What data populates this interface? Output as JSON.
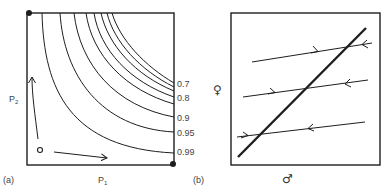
{
  "panel_a": {
    "tag": "(a)",
    "x_axis": {
      "base": "P",
      "sub": "1"
    },
    "y_axis": {
      "base": "P",
      "sub": "2"
    },
    "origin_marker": "O",
    "contours": [
      {
        "label": "0.7"
      },
      {
        "label": "0.8"
      },
      {
        "label": "0.9"
      },
      {
        "label": "0.95"
      },
      {
        "label": "0.99"
      }
    ],
    "corner_points": [
      "top-left",
      "bottom-right"
    ]
  },
  "panel_b": {
    "tag": "(b)",
    "x_axis_symbol": "♂",
    "y_axis_symbol": "♀"
  },
  "colors": {
    "line": "#1e1e1e",
    "text": "#444444",
    "background": "#ffffff"
  }
}
